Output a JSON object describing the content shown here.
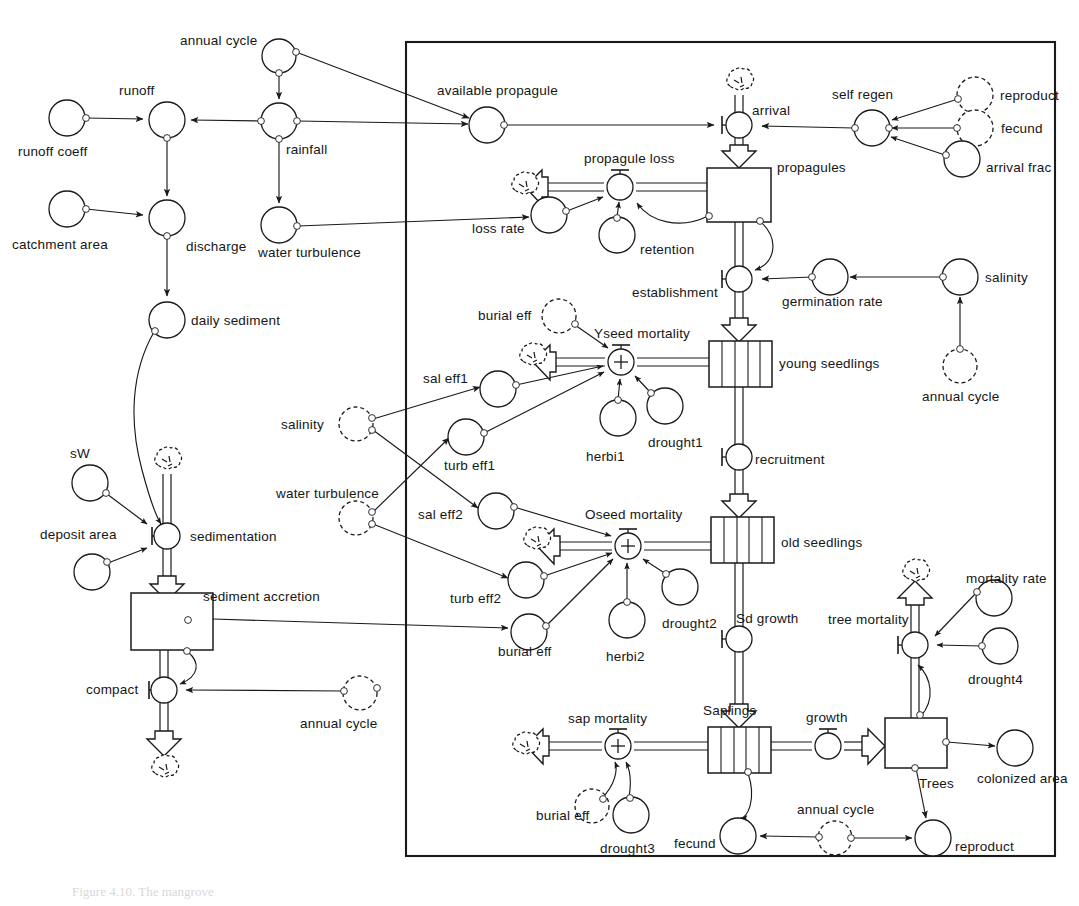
{
  "figure": {
    "type": "system-dynamics-stock-flow-diagram",
    "caption": "Figure 4.10. The mangrove",
    "boundary_box": {
      "label": "model boundary",
      "x": 406,
      "y": 42,
      "w": 649,
      "h": 814
    }
  },
  "labels": {
    "annual_cycle": "annual cycle",
    "runoff": "runoff",
    "runoff_coeff": "runoff coeff",
    "rainfall": "rainfall",
    "catchment_area": "catchment area",
    "discharge": "discharge",
    "water_turbulence": "water turbulence",
    "daily_sediment": "daily sediment",
    "sW": "sW",
    "deposit_area": "deposit area",
    "sedimentation": "sedimentation",
    "sediment_accretion": "sediment accretion",
    "compact": "compact",
    "annual_cycle_2": "annual cycle",
    "available_propagule": "available propagule",
    "arrival": "arrival",
    "self_regen": "self regen",
    "reproduct": "reproduct",
    "fecund": "fecund",
    "arrival_frac": "arrival frac",
    "propagule_loss": "propagule loss",
    "propagules": "propagules",
    "loss_rate": "loss rate",
    "retention": "retention",
    "establishment": "establishment",
    "germination_rate": "germination rate",
    "salinity_right": "salinity",
    "annual_cycle_3": "annual cycle",
    "burial_eff_1": "burial eff",
    "Yseed_mortality": "Yseed mortality",
    "young_seedlings": "young seedlings",
    "sal_eff1": "sal eff1",
    "salinity_ghost": "salinity",
    "turb_eff1": "turb eff1",
    "herbi1": "herbi1",
    "drought1": "drought1",
    "recruitment": "recruitment",
    "water_turbulence_ghost": "water turbulence",
    "sal_eff2": "sal eff2",
    "Oseed_mortality": "Oseed mortality",
    "old_seedlings": "old seedlings",
    "turb_eff2": "turb eff2",
    "drought2": "drought2",
    "herbi2": "herbi2",
    "burial_eff_2": "burial eff",
    "Sd_growth": "Sd growth",
    "tree_mortality": "tree mortality",
    "mortality_rate": "mortality rate",
    "drought4": "drought4",
    "sap_mortality": "sap mortality",
    "Saplings": "Saplings",
    "growth": "growth",
    "Trees": "Trees",
    "colonized_area": "colonized area",
    "burial_eff_3": "burial eff",
    "drought3": "drought3",
    "fecund_bottom": "fecund",
    "annual_cycle_4": "annual cycle",
    "reproduct_bottom": "reproduct"
  },
  "nodes": {
    "converters": [
      {
        "id": "annual-cycle-top",
        "label": "annual cycle",
        "cx": 279,
        "cy": 56,
        "r": 17,
        "ghost": false
      },
      {
        "id": "runoff",
        "label": "runoff",
        "cx": 167,
        "cy": 120,
        "r": 18,
        "ghost": false
      },
      {
        "id": "runoff-coeff",
        "label": "runoff coeff",
        "cx": 67,
        "cy": 118,
        "r": 18,
        "ghost": false
      },
      {
        "id": "rainfall",
        "label": "rainfall",
        "cx": 279,
        "cy": 121,
        "r": 18,
        "ghost": false
      },
      {
        "id": "catchment-area",
        "label": "catchment area",
        "cx": 67,
        "cy": 209,
        "r": 18,
        "ghost": false
      },
      {
        "id": "discharge",
        "label": "discharge",
        "cx": 167,
        "cy": 218,
        "r": 18,
        "ghost": false
      },
      {
        "id": "water-turbulence",
        "label": "water turbulence",
        "cx": 279,
        "cy": 225,
        "r": 18,
        "ghost": false
      },
      {
        "id": "daily-sediment",
        "label": "daily sediment",
        "cx": 167,
        "cy": 320,
        "r": 18,
        "ghost": false
      },
      {
        "id": "sW",
        "label": "sW",
        "cx": 90,
        "cy": 483,
        "r": 18,
        "ghost": false
      },
      {
        "id": "deposit-area",
        "label": "deposit area",
        "cx": 92,
        "cy": 572,
        "r": 18,
        "ghost": false
      },
      {
        "id": "annual-cycle-compact",
        "label": "annual cycle",
        "cx": 360,
        "cy": 693,
        "r": 17,
        "ghost": true
      },
      {
        "id": "available-propagule",
        "label": "available propagule",
        "cx": 487,
        "cy": 125,
        "r": 18,
        "ghost": false
      },
      {
        "id": "self-regen",
        "label": "self regen",
        "cx": 872,
        "cy": 128,
        "r": 18,
        "ghost": false
      },
      {
        "id": "reproduct",
        "label": "reproduct",
        "cx": 975,
        "cy": 95,
        "r": 18,
        "ghost": true
      },
      {
        "id": "fecund",
        "label": "fecund",
        "cx": 975,
        "cy": 128,
        "r": 18,
        "ghost": true
      },
      {
        "id": "arrival-frac",
        "label": "arrival frac",
        "cx": 962,
        "cy": 159,
        "r": 18,
        "ghost": false
      },
      {
        "id": "loss-rate",
        "label": "loss rate",
        "cx": 549,
        "cy": 215,
        "r": 18,
        "ghost": false
      },
      {
        "id": "retention",
        "label": "retention",
        "cx": 617,
        "cy": 235,
        "r": 18,
        "ghost": false
      },
      {
        "id": "germination-rate",
        "label": "germination rate",
        "cx": 830,
        "cy": 277,
        "r": 18,
        "ghost": false
      },
      {
        "id": "salinity-right",
        "label": "salinity",
        "cx": 960,
        "cy": 277,
        "r": 18,
        "ghost": false
      },
      {
        "id": "annual-cycle-salinity",
        "label": "annual cycle",
        "cx": 960,
        "cy": 366,
        "r": 17,
        "ghost": true
      },
      {
        "id": "burial-eff-1",
        "label": "burial eff",
        "cx": 559,
        "cy": 316,
        "r": 17,
        "ghost": true
      },
      {
        "id": "sal-eff1",
        "label": "sal eff1",
        "cx": 498,
        "cy": 389,
        "r": 18,
        "ghost": false
      },
      {
        "id": "salinity-ghost",
        "label": "salinity",
        "cx": 356,
        "cy": 424,
        "r": 17,
        "ghost": true
      },
      {
        "id": "turb-eff1",
        "label": "turb eff1",
        "cx": 466,
        "cy": 437,
        "r": 18,
        "ghost": false
      },
      {
        "id": "herbi1",
        "label": "herbi1",
        "cx": 618,
        "cy": 418,
        "r": 18,
        "ghost": false
      },
      {
        "id": "drought1",
        "label": "drought1",
        "cx": 665,
        "cy": 406,
        "r": 18,
        "ghost": false
      },
      {
        "id": "water-turbulence-ghost",
        "label": "water turbulence",
        "cx": 356,
        "cy": 518,
        "r": 17,
        "ghost": true
      },
      {
        "id": "sal-eff2",
        "label": "sal eff2",
        "cx": 496,
        "cy": 511,
        "r": 18,
        "ghost": false
      },
      {
        "id": "turb-eff2",
        "label": "turb eff2",
        "cx": 526,
        "cy": 580,
        "r": 18,
        "ghost": false
      },
      {
        "id": "burial-eff-2",
        "label": "burial eff",
        "cx": 529,
        "cy": 632,
        "r": 18,
        "ghost": false
      },
      {
        "id": "herbi2",
        "label": "herbi2",
        "cx": 627,
        "cy": 620,
        "r": 18,
        "ghost": false
      },
      {
        "id": "drought2",
        "label": "drought2",
        "cx": 680,
        "cy": 587,
        "r": 18,
        "ghost": false
      },
      {
        "id": "mortality-rate",
        "label": "mortality rate",
        "cx": 994,
        "cy": 598,
        "r": 18,
        "ghost": false
      },
      {
        "id": "drought4",
        "label": "drought4",
        "cx": 1000,
        "cy": 646,
        "r": 18,
        "ghost": false
      },
      {
        "id": "burial-eff-3",
        "label": "burial eff",
        "cx": 592,
        "cy": 806,
        "r": 17,
        "ghost": true
      },
      {
        "id": "drought3",
        "label": "drought3",
        "cx": 631,
        "cy": 815,
        "r": 18,
        "ghost": false
      },
      {
        "id": "fecund-bottom",
        "label": "fecund",
        "cx": 738,
        "cy": 836,
        "r": 18,
        "ghost": false
      },
      {
        "id": "annual-cycle-bottom",
        "label": "annual cycle",
        "cx": 835,
        "cy": 838,
        "r": 17,
        "ghost": true
      },
      {
        "id": "reproduct-bottom",
        "label": "reproduct",
        "cx": 933,
        "cy": 838,
        "r": 18,
        "ghost": false
      },
      {
        "id": "colonized-area",
        "label": "colonized area",
        "cx": 1015,
        "cy": 748,
        "r": 18,
        "ghost": false
      }
    ],
    "stocks": [
      {
        "id": "sediment-accretion",
        "label": "sediment accretion",
        "x": 131,
        "y": 593,
        "w": 82,
        "h": 57,
        "conveyor": false
      },
      {
        "id": "propagules",
        "label": "propagules",
        "x": 707,
        "y": 168,
        "w": 64,
        "h": 54,
        "conveyor": false
      },
      {
        "id": "young-seedlings",
        "label": "young seedlings",
        "x": 709,
        "y": 341,
        "w": 63,
        "h": 46,
        "conveyor": true
      },
      {
        "id": "old-seedlings",
        "label": "old seedlings",
        "x": 711,
        "y": 517,
        "w": 63,
        "h": 46,
        "conveyor": true
      },
      {
        "id": "Saplings",
        "label": "Saplings",
        "x": 708,
        "y": 727,
        "w": 63,
        "h": 46,
        "conveyor": true
      },
      {
        "id": "Trees",
        "label": "Trees",
        "x": 885,
        "y": 718,
        "w": 62,
        "h": 50,
        "conveyor": false
      }
    ],
    "flows": [
      {
        "id": "sedimentation",
        "label": "sedimentation",
        "cx": 167,
        "cy": 536
      },
      {
        "id": "compact",
        "label": "compact",
        "cx": 164,
        "cy": 690
      },
      {
        "id": "arrival",
        "label": "arrival",
        "cx": 739,
        "cy": 125
      },
      {
        "id": "propagule-loss",
        "label": "propagule loss",
        "cx": 620,
        "cy": 187
      },
      {
        "id": "establishment",
        "label": "establishment",
        "cx": 739,
        "cy": 279
      },
      {
        "id": "Yseed-mortality",
        "label": "Yseed mortality",
        "cx": 621,
        "cy": 362,
        "sign": "+"
      },
      {
        "id": "recruitment",
        "label": "recruitment",
        "cx": 739,
        "cy": 457
      },
      {
        "id": "Oseed-mortality",
        "label": "Oseed mortality",
        "cx": 628,
        "cy": 546,
        "sign": "+"
      },
      {
        "id": "Sd-growth",
        "label": "Sd growth",
        "cx": 739,
        "cy": 639
      },
      {
        "id": "tree-mortality",
        "label": "tree mortality",
        "cx": 915,
        "cy": 645
      },
      {
        "id": "sap-mortality",
        "label": "sap mortality",
        "cx": 618,
        "cy": 746,
        "sign": "+"
      },
      {
        "id": "growth",
        "label": "growth",
        "cx": 828,
        "cy": 746
      }
    ],
    "clouds": [
      {
        "id": "cloud-sedimentation",
        "cx": 167,
        "cy": 461
      },
      {
        "id": "cloud-compact",
        "cx": 164,
        "cy": 769
      },
      {
        "id": "cloud-arrival",
        "cx": 739,
        "cy": 82
      },
      {
        "id": "cloud-propagule-loss",
        "cx": 524,
        "cy": 186
      },
      {
        "id": "cloud-yseed",
        "cx": 529,
        "cy": 357
      },
      {
        "id": "cloud-oseed",
        "cx": 533,
        "cy": 541
      },
      {
        "id": "cloud-tree",
        "cx": 906,
        "cy": 573
      },
      {
        "id": "cloud-sap",
        "cx": 523,
        "cy": 746
      }
    ]
  },
  "colors": {
    "stroke": "#1a1a1a",
    "text": "#161616",
    "background": "#ffffff",
    "ghost_dash": "#2a2a2a"
  }
}
